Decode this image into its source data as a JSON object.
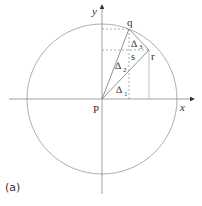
{
  "figure": {
    "panel_label": "(a)",
    "axes": {
      "x_label": "x",
      "y_label": "y"
    },
    "points": {
      "p": "P",
      "q": "q",
      "r": "r",
      "s": "s"
    },
    "triangles": [
      {
        "label": "┱1",
        "symbol": "∆",
        "subscript": "1"
      },
      {
        "label": "┱2",
        "symbol": "∆",
        "subscript": "2"
      },
      {
        "label": "┱3",
        "symbol": "∆",
        "subscript": "3"
      }
    ],
    "colors": {
      "lines": "#888888",
      "text": "#333333",
      "background": "#ffffff"
    }
  }
}
